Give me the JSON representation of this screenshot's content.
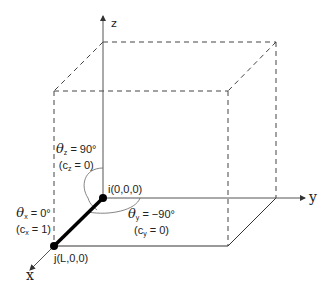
{
  "diagram": {
    "axes": {
      "x_label": "x",
      "y_label": "y",
      "z_label": "z"
    },
    "points": {
      "i_label": "i(0,0,0)",
      "j_label": "j(L,0,0)"
    },
    "angles": {
      "theta_z": {
        "symbol": "θ",
        "sub": "z",
        "value": " = 90°",
        "cos_pre": "(c",
        "cos_sub": "z",
        "cos_val": " = 0)"
      },
      "theta_x": {
        "symbol": "θ",
        "sub": "x",
        "value": " = 0°",
        "cos_pre": "(c",
        "cos_sub": "x",
        "cos_val": " = 1)"
      },
      "theta_y": {
        "symbol": "θ",
        "sub": "y",
        "value": " = −90°",
        "cos_pre": "(c",
        "cos_sub": "y",
        "cos_val": " = 0)"
      }
    },
    "colors": {
      "line": "#333333",
      "dashed": "#444444",
      "member": "#000000",
      "arc": "#666666"
    }
  }
}
